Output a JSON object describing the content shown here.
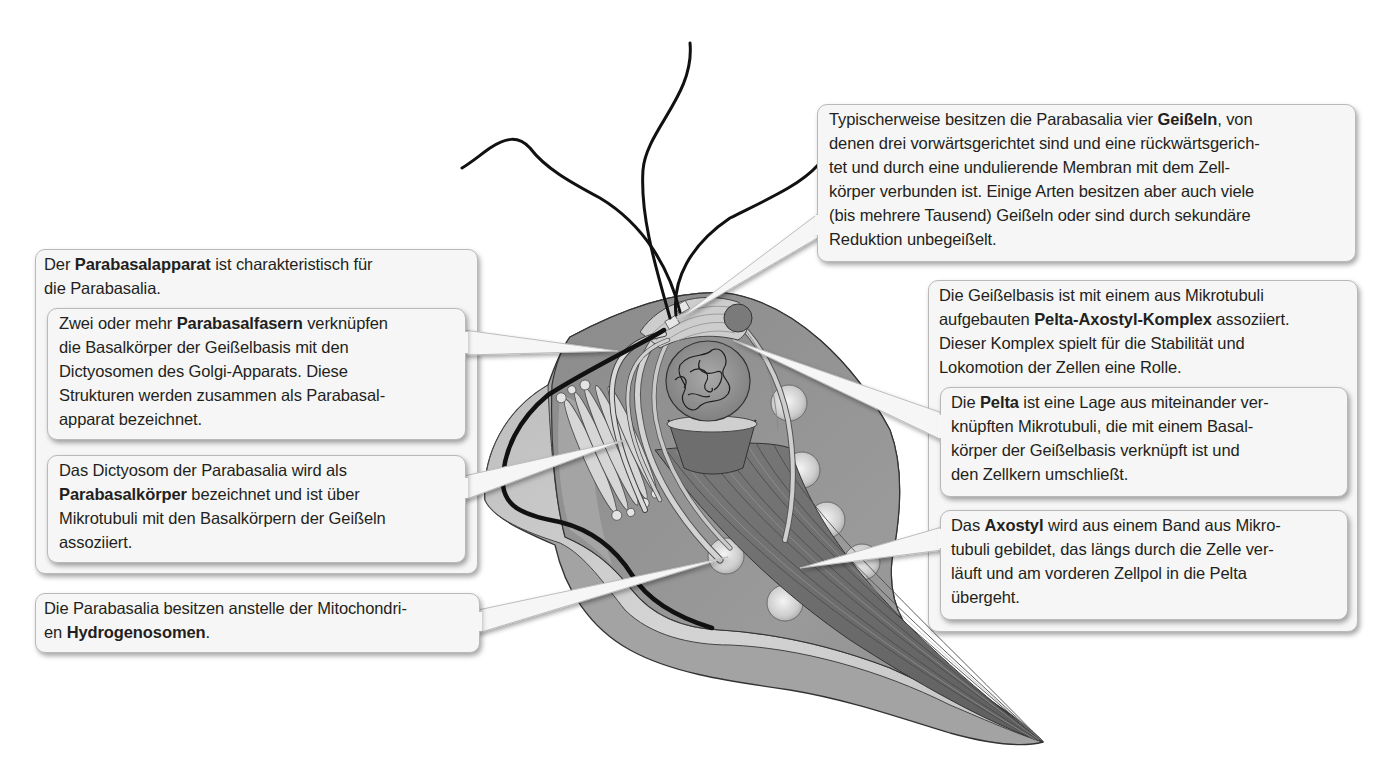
{
  "colors": {
    "text": "#231f20",
    "box_fill": "#f6f6f6",
    "box_border": "#b9b9b9",
    "cell_outer": "#9d9d9d",
    "cell_fold": "#c8c8c8",
    "cell_body": "#939393",
    "axostyl": "#6f6f6f",
    "flagellum": "#111111"
  },
  "callouts": {
    "flagella": {
      "lines": [
        {
          "pre": "Typischerweise besitzen die Parabasalia vier ",
          "bold": "Geißeln",
          "post": ", von"
        },
        "denen drei vorwärtsgerichtet sind und eine rückwärtsgerich-",
        "tet und durch eine undulierende Membran mit dem Zell-",
        "körper verbunden ist. Einige Arten besitzen aber auch viele",
        "(bis mehrere Tausend) Geißeln oder sind durch sekundäre",
        "Reduktion unbegeißelt."
      ]
    },
    "parabasalapparat": {
      "lines": [
        {
          "pre": "Der ",
          "bold": "Parabasalapparat",
          "post": " ist charakteristisch für"
        },
        "die Parabasalia."
      ],
      "parabasalfasern": {
        "lines": [
          {
            "pre": "Zwei oder mehr ",
            "bold": "Parabasalfasern",
            "post": " verknüpfen"
          },
          "die Basalkörper der Geißelbasis mit den",
          "Dictyosomen des Golgi-Apparats. Diese",
          "Strukturen werden zusammen als Parabasal-",
          "apparat bezeichnet."
        ]
      },
      "parabasalkoerper": {
        "lines": [
          "Das Dictyosom der Parabasalia wird als",
          {
            "pre": "",
            "bold": "Parabasalkörper",
            "post": " bezeichnet und ist über"
          },
          "Mikrotubuli mit den Basalkörpern der Geißeln",
          "assoziiert."
        ]
      }
    },
    "hydrogenosomen": {
      "lines": [
        "Die Parabasalia besitzen anstelle der Mitochondri-",
        {
          "pre": "en ",
          "bold": "Hydrogenosomen",
          "post": "."
        }
      ]
    },
    "pelta_axostyl": {
      "lines": [
        "Die Geißelbasis ist mit einem aus Mikrotubuli",
        {
          "pre": "aufgebauten ",
          "bold": "Pelta-Axostyl-Komplex",
          "post": " assoziiert."
        },
        "Dieser Komplex spielt für die Stabilität und",
        "Lokomotion der Zellen eine Rolle."
      ],
      "pelta": {
        "lines": [
          {
            "pre": "Die ",
            "bold": "Pelta",
            "post": " ist eine Lage aus miteinander ver-"
          },
          "knüpften Mikrotubuli, die mit einem Basal-",
          "körper der Geißelbasis verknüpft ist und",
          "den Zellkern umschließt."
        ]
      },
      "axostyl": {
        "lines": [
          {
            "pre": "Das ",
            "bold": "Axostyl",
            "post": " wird aus einem Band aus Mikro-"
          },
          "tubuli gebildet, das längs durch die Zelle ver-",
          "läuft und am vorderen Zellpol in die Pelta",
          "übergeht."
        ]
      }
    }
  }
}
